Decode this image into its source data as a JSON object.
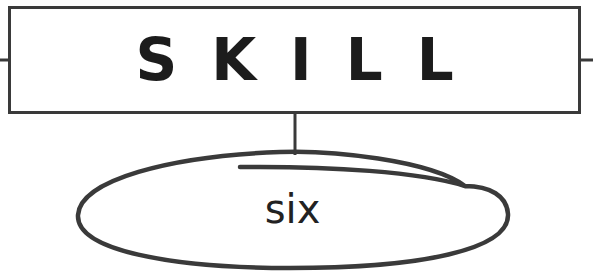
{
  "box": {
    "title": "SKILL",
    "border_color": "#3a3a3a"
  },
  "oval": {
    "label": "six",
    "stroke_color": "#3a3a3a"
  }
}
